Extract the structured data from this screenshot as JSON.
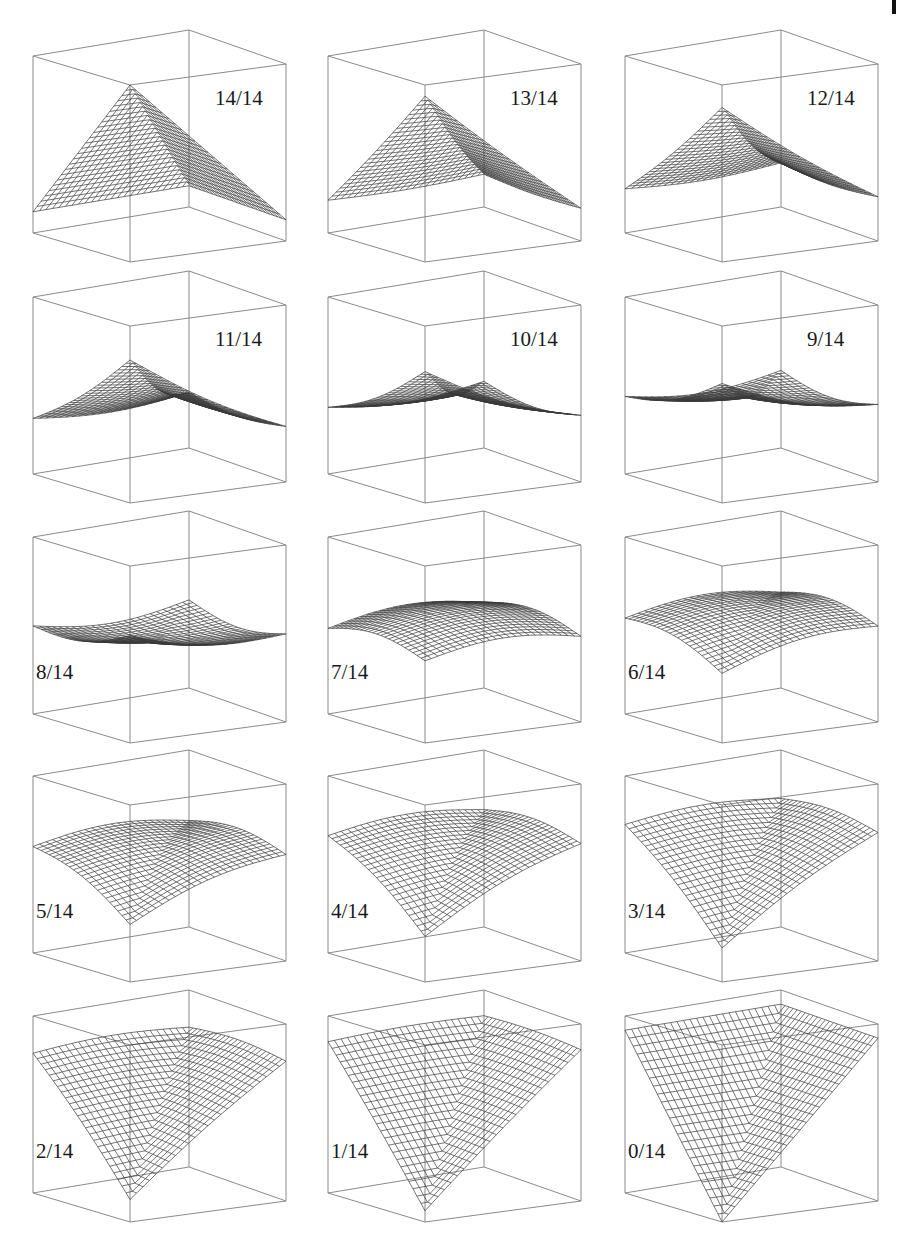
{
  "figure": {
    "colors": {
      "box": "#8a8a8a",
      "mesh": "#3a3a3a",
      "label": "#1a1a1a",
      "background": "#ffffff"
    },
    "grid": {
      "rows": 5,
      "cols": 3,
      "mesh_lines": 24
    },
    "panels": [
      {
        "label": "14/14",
        "t": 14,
        "label_pos": "top-right"
      },
      {
        "label": "13/14",
        "t": 13,
        "label_pos": "top-right"
      },
      {
        "label": "12/14",
        "t": 12,
        "label_pos": "top-right"
      },
      {
        "label": "11/14",
        "t": 11,
        "label_pos": "top-right"
      },
      {
        "label": "10/14",
        "t": 10,
        "label_pos": "top-right"
      },
      {
        "label": "9/14",
        "t": 9,
        "label_pos": "top-right"
      },
      {
        "label": "8/14",
        "t": 8,
        "label_pos": "bottom-left"
      },
      {
        "label": "7/14",
        "t": 7,
        "label_pos": "bottom-left"
      },
      {
        "label": "6/14",
        "t": 6,
        "label_pos": "bottom-left"
      },
      {
        "label": "5/14",
        "t": 5,
        "label_pos": "bottom-left"
      },
      {
        "label": "4/14",
        "t": 4,
        "label_pos": "bottom-left"
      },
      {
        "label": "3/14",
        "t": 3,
        "label_pos": "bottom-left"
      },
      {
        "label": "2/14",
        "t": 2,
        "label_pos": "bottom-left"
      },
      {
        "label": "1/14",
        "t": 1,
        "label_pos": "bottom-left"
      },
      {
        "label": "0/14",
        "t": 0,
        "label_pos": "bottom-left"
      }
    ]
  }
}
